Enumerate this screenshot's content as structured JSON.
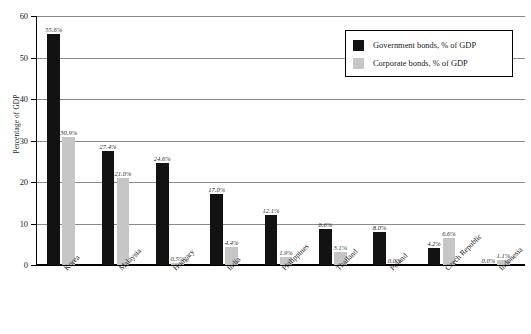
{
  "chart_data": {
    "type": "bar",
    "title": "",
    "xlabel": "",
    "ylabel": "Percentage of GDP",
    "ylim": [
      0,
      60
    ],
    "yticks": [
      0,
      10,
      20,
      30,
      40,
      50,
      60
    ],
    "ytick_labels": [
      "0",
      "10",
      "20",
      "30",
      "40",
      "50",
      "60"
    ],
    "grid": true,
    "legend_position": "top-right",
    "categories": [
      "Korea",
      "Malaysia",
      "Hungary",
      "India",
      "Philippines",
      "Thailand",
      "Poland",
      "Czech Republic",
      "Indonesia"
    ],
    "series": [
      {
        "name": "Government bonds, % of GDP",
        "color": "#121212",
        "values": [
          55.6,
          27.4,
          24.6,
          17.0,
          12.1,
          8.6,
          8.0,
          4.2,
          0.0
        ],
        "labels": [
          "55.6%",
          "27.4%",
          "24.6%",
          "17.0%",
          "12.1%",
          "8.6%",
          "8.0%",
          "4.2%",
          "0.0%"
        ]
      },
      {
        "name": "Corporate bonds, % of GDP",
        "color": "#c6c6c6",
        "values": [
          30.9,
          21.0,
          0.5,
          4.4,
          1.9,
          3.1,
          0.0,
          6.6,
          1.1
        ],
        "labels": [
          "30.9%",
          "21.0%",
          "0.5%",
          "4.4%",
          "1.9%",
          "3.1%",
          "0.0%",
          "6.6%",
          "1.1%"
        ]
      }
    ]
  },
  "legend": {
    "items": [
      {
        "label": "Government bonds, % of GDP"
      },
      {
        "label": "Corporate bonds, % of GDP"
      }
    ]
  },
  "axis": {
    "y_title": "Percentage of GDP"
  }
}
